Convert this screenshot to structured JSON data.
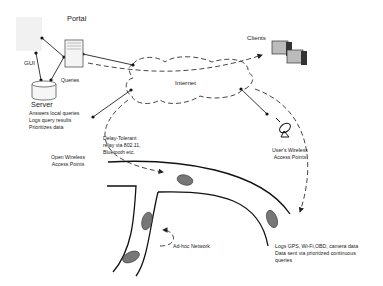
{
  "diagram": {
    "nodes": {
      "portal": {
        "label": "Portal"
      },
      "gui": {
        "label": "GUI"
      },
      "queries": {
        "label": "Queries"
      },
      "server": {
        "label": "Server",
        "notes": [
          "Answers local queries",
          "Logs query results",
          "Prioritizes data"
        ]
      },
      "internet": {
        "label": "Internet"
      },
      "clients": {
        "label": "Clients"
      },
      "users_ap": {
        "label_line1": "User's Wireless",
        "label_line2": "Access Points"
      },
      "open_ap": {
        "label_line1": "Open Wireless",
        "label_line2": "Access Points"
      },
      "dtn": {
        "line1": "Delay-Tolerant",
        "line2": "relay via 802.11,",
        "line3": "Bluetooth etc."
      },
      "adhoc": {
        "label": "Ad-hoc Network"
      },
      "vehicle": {
        "line1": "Logs GPS, Wi-Fi,OBD, camera data",
        "line2": "Data sent via prioritized continuous",
        "line3": "queries"
      }
    },
    "icons": [
      "server-tower-icon",
      "database-cylinder-icon",
      "client-computer-icon",
      "satellite-dish-icon",
      "car-icon"
    ]
  }
}
